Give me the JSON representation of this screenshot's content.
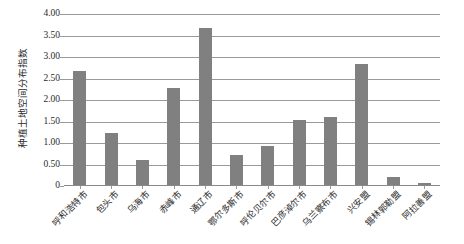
{
  "chart_data": {
    "type": "bar",
    "title": "",
    "xlabel": "",
    "ylabel": "种植土地空间分布指数",
    "ylim": [
      0,
      4.0
    ],
    "grid": true,
    "legend": false,
    "bar_color": "#808080",
    "gridline_color": "#9a9a9a",
    "ytick_labels": [
      "4.00",
      "3.50",
      "3.00",
      "2.50",
      "2.00",
      "1.50",
      "1.00",
      "0.50",
      "0"
    ],
    "ytick_values": [
      4.0,
      3.5,
      3.0,
      2.5,
      2.0,
      1.5,
      1.0,
      0.5,
      0
    ],
    "categories": [
      "呼和浩特市",
      "包头市",
      "乌海市",
      "赤峰市",
      "通辽市",
      "鄂尔多斯市",
      "呼伦贝尔市",
      "巴彦淖尔市",
      "乌兰察布市",
      "兴安盟",
      "锡林郭勒盟",
      "阿拉善盟"
    ],
    "values": [
      2.66,
      1.22,
      0.58,
      2.26,
      3.65,
      0.69,
      0.91,
      1.51,
      1.58,
      2.82,
      0.19,
      0.04
    ]
  }
}
